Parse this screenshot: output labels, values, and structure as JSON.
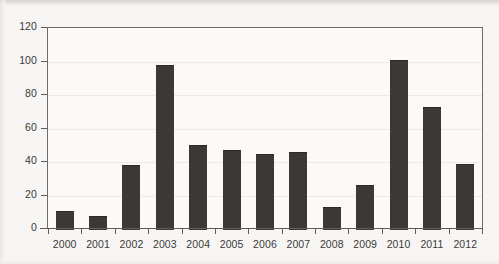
{
  "chart_data": {
    "type": "bar",
    "title": "",
    "subtitle": "",
    "xlabel": "",
    "ylabel": "",
    "categories": [
      "2000",
      "2001",
      "2002",
      "2003",
      "2004",
      "2005",
      "2006",
      "2007",
      "2008",
      "2009",
      "2010",
      "2011",
      "2012"
    ],
    "values": [
      11,
      8,
      38,
      98,
      50,
      47,
      45,
      46,
      13,
      26,
      101,
      73,
      39
    ],
    "series": [
      {
        "name": "",
        "values": [
          11,
          8,
          38,
          98,
          50,
          47,
          45,
          46,
          13,
          26,
          101,
          73,
          39
        ]
      }
    ],
    "ylim": [
      0,
      120
    ],
    "yticks": [
      0,
      20,
      40,
      60,
      80,
      100,
      120
    ],
    "ytick_labels": [
      "0",
      "20",
      "40",
      "60",
      "80",
      "100",
      "120"
    ],
    "xtick_labels": [
      "2000",
      "2001",
      "2002",
      "2003",
      "2004",
      "2005",
      "2006",
      "2007",
      "2008",
      "2009",
      "2010",
      "2011",
      "2012"
    ],
    "grid": true,
    "legend": false,
    "legend_position": "none",
    "bar_color": "#3a3937",
    "axis_color": "#5e5c5a",
    "grid_color": "#eceae6",
    "background_color": "#f7f6f4",
    "plot_background_color": "#fbfaf9"
  }
}
